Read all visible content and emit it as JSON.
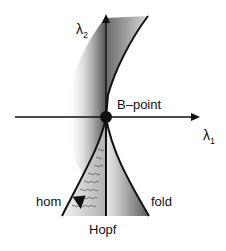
{
  "diagram": {
    "axes": {
      "x_label": "λ",
      "x_sub": "1",
      "y_label": "λ",
      "y_sub": "2"
    },
    "point_label": "B–point",
    "curves": {
      "hom": "hom",
      "fold": "fold",
      "hopf": "Hopf"
    },
    "colors": {
      "line": "#111111",
      "shade_dark": "#555555",
      "shade_light": "#ffffff"
    }
  }
}
